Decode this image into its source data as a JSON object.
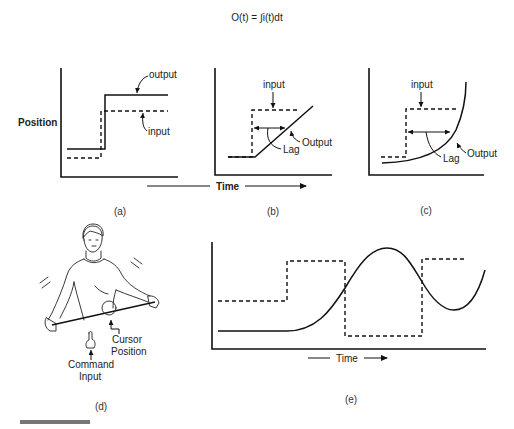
{
  "equation": "O(t) = ∫i(t)dt",
  "panel_a": {
    "caption": "(a)",
    "y_axis_label": "Position",
    "output_label": "output",
    "input_label": "input"
  },
  "panel_b": {
    "caption": "(b)",
    "input_label": "input",
    "output_label": "Output",
    "lag_label": "Lag"
  },
  "panel_c": {
    "caption": "(c)",
    "input_label": "input",
    "output_label": "Output",
    "lag_label": "Lag"
  },
  "shared_x_axis_label": "Time",
  "panel_d": {
    "caption": "(d)",
    "cursor_label_line1": "Cursor",
    "cursor_label_line2": "Position",
    "command_label_line1": "Command",
    "command_label_line2": "Input"
  },
  "panel_e": {
    "caption": "(e)",
    "x_axis_label": "Time"
  },
  "colors": {
    "ink": "#111111",
    "background": "#ffffff",
    "footer_bar": "#777777"
  }
}
